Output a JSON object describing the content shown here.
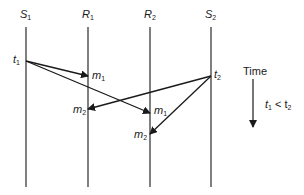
{
  "diagram": {
    "type": "message-sequence",
    "processes": [
      {
        "name": "S",
        "sub": "1",
        "x": 26
      },
      {
        "name": "R",
        "sub": "1",
        "x": 88
      },
      {
        "name": "R",
        "sub": "2",
        "x": 150
      },
      {
        "name": "S",
        "sub": "2",
        "x": 211
      }
    ],
    "events": [
      {
        "name": "t",
        "sub": "1",
        "process": "S1"
      },
      {
        "name": "t",
        "sub": "2",
        "process": "S2"
      }
    ],
    "messages": [
      {
        "name": "m",
        "sub": "1",
        "from": "S1",
        "to": "R1"
      },
      {
        "name": "m",
        "sub": "1",
        "from": "S1",
        "to": "R2"
      },
      {
        "name": "m",
        "sub": "2",
        "from": "S2",
        "to": "R1"
      },
      {
        "name": "m",
        "sub": "2",
        "from": "S2",
        "to": "R2"
      }
    ],
    "legend": {
      "time_label": "Time",
      "condition_t": "t",
      "condition_sub1": "1",
      "condition_op": " < t",
      "condition_sub2": "2"
    },
    "colors": {
      "line": "#2a2a2a",
      "text": "#1a1a1a"
    }
  }
}
